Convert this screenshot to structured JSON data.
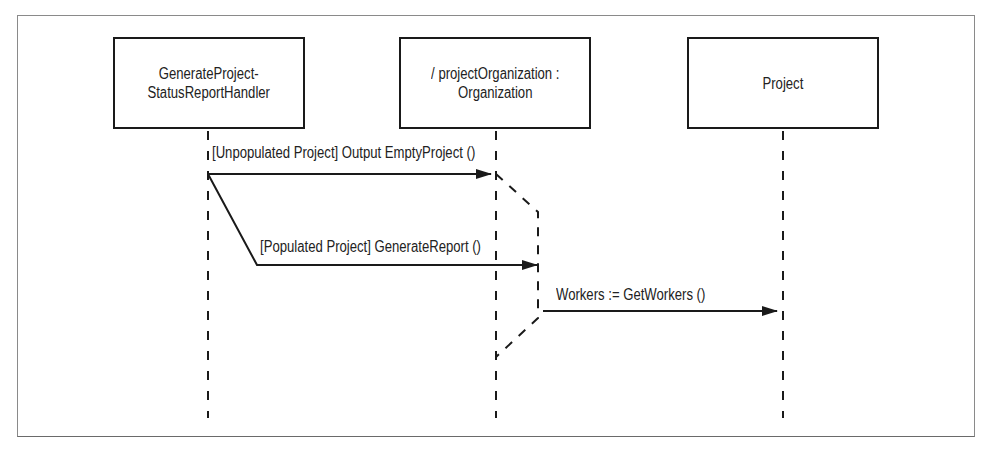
{
  "diagram": {
    "type": "UML sequence diagram",
    "colors": {
      "stroke": "#1a1a1a",
      "text": "#222222",
      "frame": "#8a8a8a",
      "background": "#ffffff"
    },
    "lifelines": [
      {
        "id": "handler",
        "label": "GeneratePProject-\nStatusReportHandler",
        "x": 208
      },
      {
        "id": "organization",
        "label": "/ projectOrganization :\nOrganization",
        "x": 496
      },
      {
        "id": "project",
        "label": "Project",
        "x": 783
      }
    ],
    "messages": [
      {
        "from": "handler",
        "to": "organization",
        "guard": "[Unpopulated Project]",
        "label": "[Unpopulated Project] Output EmptyProject ()"
      },
      {
        "from": "handler",
        "to": "organization",
        "guard": "[Populated Project]",
        "label": "[Populated Project] GenerateReport ()"
      },
      {
        "from": "organization",
        "to": "project",
        "label": "Workers := GetWorkers ()"
      }
    ]
  },
  "labels": {
    "box1": "GenerateProject-\nStatusReportHandler",
    "box2": "/ projectOrganization :\nOrganization",
    "box3": "Project",
    "msg1": "[Unpopulated Project] Output EmptyProject ()",
    "msg2": "[Populated Project] GenerateReport ()",
    "msg3": "Workers := GetWorkers ()"
  }
}
